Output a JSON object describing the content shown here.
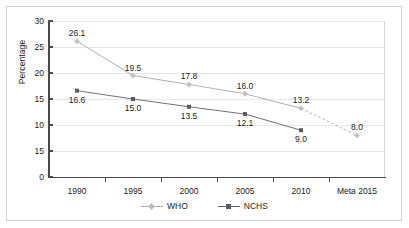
{
  "chart_data": {
    "type": "line",
    "title": "",
    "xlabel": "",
    "ylabel": "Percentage",
    "categories": [
      "1990",
      "1995",
      "2000",
      "2005",
      "2010",
      "Meta 2015"
    ],
    "ylim": [
      0,
      30
    ],
    "ytick_labels": [
      "30",
      "25",
      "20",
      "15",
      "10",
      "15",
      "0"
    ],
    "ytick_values": [
      30,
      25,
      20,
      15,
      10,
      5,
      0
    ],
    "grid": true,
    "legend_position": "bottom",
    "series": [
      {
        "name": "WHO",
        "color": "#a8a8a8",
        "marker": "diamond",
        "values": [
          26.1,
          19.5,
          17.8,
          16.0,
          13.2,
          8.0
        ],
        "labels": [
          "26.1",
          "19.5",
          "17.8",
          "16.0",
          "13.2",
          "8.0"
        ],
        "dashed_from_index": 4
      },
      {
        "name": "NCHS",
        "color": "#616161",
        "marker": "square",
        "values": [
          16.6,
          15.0,
          13.5,
          12.1,
          9.0,
          null
        ],
        "labels": [
          "16.6",
          "15.0",
          "13.5",
          "12.1",
          "9.0",
          ""
        ]
      }
    ]
  },
  "legend": {
    "items": [
      {
        "label": "WHO"
      },
      {
        "label": "NCHS"
      }
    ]
  },
  "colors": {
    "who": "#a8a8a8",
    "nchs": "#616161",
    "axis": "#4a4a4a",
    "grid": "#e6e6e6",
    "frame": "#d2d2d2",
    "text": "#1b1b1b"
  }
}
